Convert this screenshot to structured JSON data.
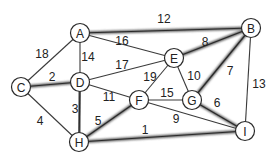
{
  "diagram": {
    "type": "weighted-undirected-graph",
    "nodes": [
      {
        "id": "A",
        "label": "A",
        "x": 80,
        "y": 33
      },
      {
        "id": "B",
        "label": "B",
        "x": 251,
        "y": 28
      },
      {
        "id": "C",
        "label": "C",
        "x": 21,
        "y": 87
      },
      {
        "id": "D",
        "label": "D",
        "x": 80,
        "y": 82
      },
      {
        "id": "E",
        "label": "E",
        "x": 174,
        "y": 58
      },
      {
        "id": "F",
        "label": "F",
        "x": 139,
        "y": 100
      },
      {
        "id": "G",
        "label": "G",
        "x": 192,
        "y": 100
      },
      {
        "id": "H",
        "label": "H",
        "x": 79,
        "y": 142
      },
      {
        "id": "I",
        "label": "I",
        "x": 245,
        "y": 131
      }
    ],
    "edges": [
      {
        "from": "A",
        "to": "B",
        "weight": "12",
        "highlighted": true,
        "lx": 164,
        "ly": 19
      },
      {
        "from": "A",
        "to": "C",
        "weight": "18",
        "highlighted": false,
        "lx": 42,
        "ly": 54
      },
      {
        "from": "A",
        "to": "D",
        "weight": "14",
        "highlighted": false,
        "lx": 88,
        "ly": 57
      },
      {
        "from": "A",
        "to": "E",
        "weight": "16",
        "highlighted": false,
        "lx": 122,
        "ly": 41
      },
      {
        "from": "C",
        "to": "D",
        "weight": "2",
        "highlighted": true,
        "lx": 52,
        "ly": 77
      },
      {
        "from": "C",
        "to": "H",
        "weight": "4",
        "highlighted": false,
        "lx": 40,
        "ly": 121
      },
      {
        "from": "D",
        "to": "E",
        "weight": "17",
        "highlighted": false,
        "lx": 122,
        "ly": 65
      },
      {
        "from": "D",
        "to": "F",
        "weight": "11",
        "highlighted": false,
        "lx": 109,
        "ly": 97
      },
      {
        "from": "D",
        "to": "H",
        "weight": "3",
        "highlighted": true,
        "lx": 75,
        "ly": 109
      },
      {
        "from": "E",
        "to": "B",
        "weight": "8",
        "highlighted": true,
        "lx": 205,
        "ly": 42
      },
      {
        "from": "E",
        "to": "F",
        "weight": "19",
        "highlighted": false,
        "lx": 150,
        "ly": 77
      },
      {
        "from": "E",
        "to": "G",
        "weight": "10",
        "highlighted": false,
        "lx": 194,
        "ly": 76
      },
      {
        "from": "B",
        "to": "G",
        "weight": "7",
        "highlighted": true,
        "lx": 230,
        "ly": 71
      },
      {
        "from": "B",
        "to": "I",
        "weight": "13",
        "highlighted": false,
        "lx": 259,
        "ly": 84
      },
      {
        "from": "F",
        "to": "G",
        "weight": "15",
        "highlighted": false,
        "lx": 167,
        "ly": 93
      },
      {
        "from": "F",
        "to": "I",
        "weight": "9",
        "highlighted": false,
        "lx": 176,
        "ly": 119
      },
      {
        "from": "F",
        "to": "H",
        "weight": "5",
        "highlighted": true,
        "lx": 98,
        "ly": 121
      },
      {
        "from": "G",
        "to": "I",
        "weight": "6",
        "highlighted": true,
        "lx": 217,
        "ly": 103
      },
      {
        "from": "H",
        "to": "I",
        "weight": "1",
        "highlighted": true,
        "lx": 145,
        "ly": 130
      }
    ]
  }
}
